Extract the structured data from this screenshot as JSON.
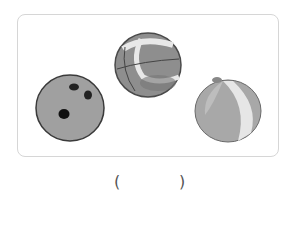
{
  "figure": {
    "items": [
      {
        "name": "bowling-ball",
        "label": "bowling ball"
      },
      {
        "name": "basketball",
        "label": "basketball"
      },
      {
        "name": "beach-ball",
        "label": "beach ball"
      }
    ]
  },
  "answer": {
    "open_paren": "(",
    "blank": "",
    "close_paren": ")"
  },
  "colors": {
    "border": "#d6d6d6",
    "ball_fill": "#9a9a9a",
    "ball_outline": "#555555"
  }
}
